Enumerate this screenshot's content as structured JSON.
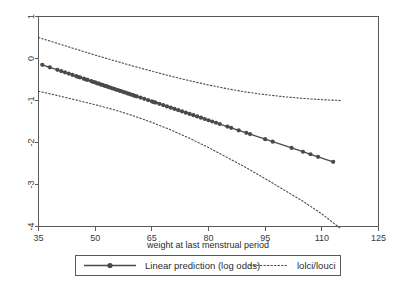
{
  "chart_data": {
    "type": "line",
    "title": "",
    "xlabel": "weight at last menstrual period",
    "ylabel": "",
    "xlim": [
      35,
      125
    ],
    "ylim": [
      -4,
      1
    ],
    "xticks": [
      35,
      50,
      65,
      80,
      95,
      110,
      125
    ],
    "xtick_labels": [
      "35",
      "50",
      "65",
      "80",
      "95",
      "110",
      "125"
    ],
    "yticks": [
      1,
      0,
      -1,
      -2,
      -3,
      -4
    ],
    "ytick_labels": [
      "1",
      "0",
      "-1",
      "-2",
      "-3",
      "-4"
    ],
    "grid": false,
    "legend_position": "bottom",
    "series": [
      {
        "name": "Linear prediction (log odds)",
        "style": "solid-with-markers",
        "marker": "circle",
        "x": [
          36,
          38,
          40,
          41,
          42,
          43,
          44,
          45,
          45.5,
          46,
          47,
          47.5,
          48,
          49,
          49.5,
          50,
          50.5,
          51,
          51.5,
          52,
          52.5,
          53,
          53.5,
          54,
          54.5,
          55,
          55.5,
          56,
          56.5,
          57,
          57.5,
          58,
          58.5,
          59,
          59.5,
          60,
          60.5,
          61,
          62,
          63,
          64,
          65,
          65.5,
          66,
          67,
          68,
          69,
          70,
          71,
          72,
          73,
          74,
          75,
          76,
          77,
          78,
          79,
          80,
          81,
          82,
          83,
          85,
          86,
          88,
          90,
          91,
          95,
          97,
          102,
          105,
          107,
          109,
          113
        ],
        "y": [
          -0.15,
          -0.21,
          -0.27,
          -0.3,
          -0.33,
          -0.36,
          -0.39,
          -0.42,
          -0.44,
          -0.45,
          -0.48,
          -0.5,
          -0.51,
          -0.54,
          -0.56,
          -0.57,
          -0.59,
          -0.6,
          -0.62,
          -0.63,
          -0.65,
          -0.66,
          -0.68,
          -0.69,
          -0.71,
          -0.72,
          -0.74,
          -0.75,
          -0.77,
          -0.78,
          -0.8,
          -0.81,
          -0.83,
          -0.84,
          -0.86,
          -0.87,
          -0.89,
          -0.9,
          -0.93,
          -0.96,
          -0.99,
          -1.02,
          -1.04,
          -1.05,
          -1.08,
          -1.11,
          -1.14,
          -1.17,
          -1.2,
          -1.23,
          -1.26,
          -1.29,
          -1.32,
          -1.35,
          -1.38,
          -1.41,
          -1.44,
          -1.47,
          -1.5,
          -1.53,
          -1.56,
          -1.62,
          -1.65,
          -1.71,
          -1.77,
          -1.8,
          -1.92,
          -1.98,
          -2.13,
          -2.22,
          -2.28,
          -2.34,
          -2.46
        ]
      },
      {
        "name": "lolci",
        "style": "dotted",
        "description": "lower confidence limit",
        "x": [
          35,
          40,
          45,
          50,
          55,
          60,
          65,
          70,
          75,
          80,
          85,
          90,
          95,
          100,
          105,
          110,
          115
        ],
        "y": [
          -0.78,
          -0.88,
          -0.99,
          -1.1,
          -1.22,
          -1.36,
          -1.52,
          -1.7,
          -1.9,
          -2.12,
          -2.36,
          -2.6,
          -2.86,
          -3.13,
          -3.4,
          -3.7,
          -4.05
        ]
      },
      {
        "name": "louci",
        "style": "dotted",
        "description": "upper confidence limit",
        "x": [
          35,
          40,
          45,
          50,
          55,
          60,
          65,
          70,
          75,
          80,
          85,
          90,
          95,
          100,
          105,
          110,
          115
        ],
        "y": [
          0.5,
          0.36,
          0.22,
          0.08,
          -0.05,
          -0.18,
          -0.3,
          -0.42,
          -0.53,
          -0.63,
          -0.72,
          -0.8,
          -0.86,
          -0.91,
          -0.95,
          -0.98,
          -1.0
        ]
      }
    ],
    "legend": [
      {
        "label": "Linear prediction (log odds)",
        "style": "solid-with-marker"
      },
      {
        "label": "lolci/louci",
        "style": "dotted"
      }
    ]
  },
  "colors": {
    "line": "#4a4a4a",
    "frame": "#5a5a5a",
    "text": "#2b2b2b",
    "background": "#ffffff"
  }
}
